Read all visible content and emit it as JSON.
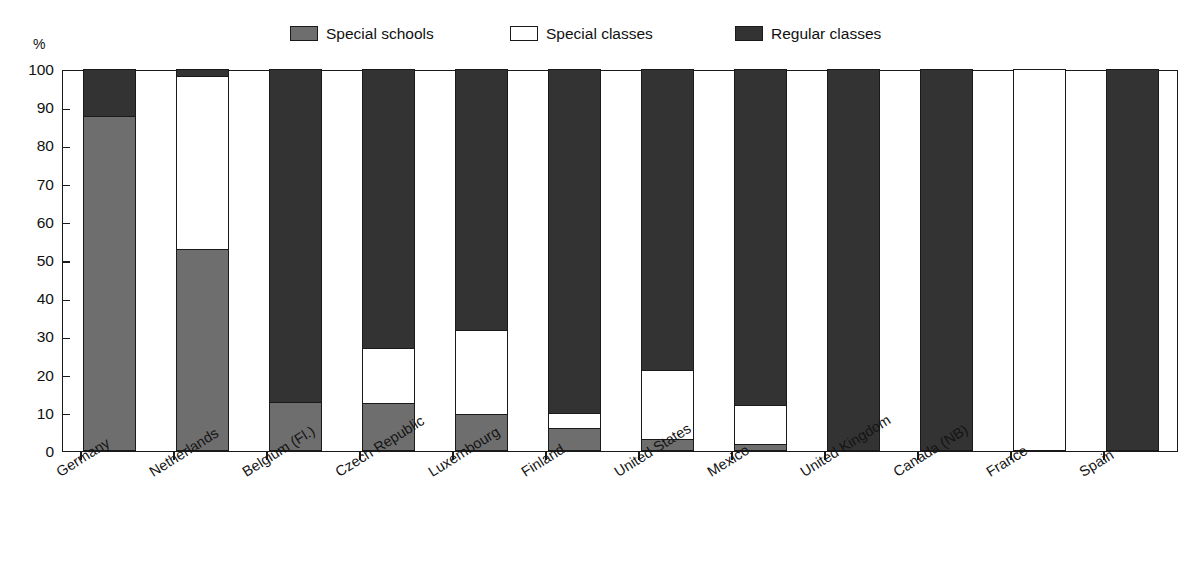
{
  "chart_data": {
    "type": "bar",
    "stacked": true,
    "title": "",
    "subtitle": "",
    "xlabel": "",
    "ylabel": "%",
    "ylim": [
      0,
      100
    ],
    "ytick_labels": [
      "0",
      "10",
      "20",
      "30",
      "40",
      "50",
      "60",
      "70",
      "80",
      "90",
      "100"
    ],
    "ytick_values": [
      0,
      10,
      20,
      30,
      40,
      50,
      60,
      70,
      80,
      90,
      100
    ],
    "grid": false,
    "legend_position": "top",
    "categories": [
      "Germany",
      "Netherlands",
      "Belgium (Fl.)",
      "Czech Republic",
      "Luxembourg",
      "Finland",
      "United States",
      "Mexico",
      "United Kingdom",
      "Canada (NB)",
      "France",
      "Spain"
    ],
    "series": [
      {
        "name": "Special schools",
        "color": "#6e6e6e",
        "values": [
          87.5,
          52.5,
          12.5,
          12.3,
          9.4,
          5.8,
          3.0,
          1.7,
          0,
          0,
          0,
          0
        ]
      },
      {
        "name": "Special classes",
        "color": "#ffffff",
        "values": [
          0,
          45.5,
          0,
          14.4,
          22.0,
          4.0,
          18.0,
          10.1,
          0,
          0,
          100,
          0
        ]
      },
      {
        "name": "Regular classes",
        "color": "#333333",
        "values": [
          12.5,
          2.0,
          87.5,
          73.3,
          68.6,
          90.2,
          79.0,
          88.2,
          100,
          100,
          0,
          100
        ]
      }
    ]
  },
  "legend": {
    "items": [
      {
        "label": "Special schools",
        "swatch": "#6e6e6e",
        "x": 290
      },
      {
        "label": "Special classes",
        "swatch": "#ffffff",
        "x": 510
      },
      {
        "label": "Regular classes",
        "swatch": "#333333",
        "x": 735
      }
    ]
  },
  "axis": {
    "y_unit": "%"
  }
}
